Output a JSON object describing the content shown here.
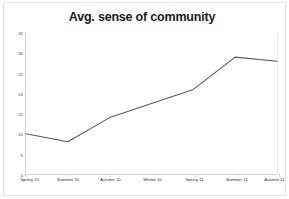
{
  "chart_data": {
    "type": "line",
    "title": "Avg. sense of community",
    "xlabel": "",
    "ylabel": "",
    "categories": [
      "Spring 10",
      "Summer 10",
      "Autumn 10",
      "Winter 10",
      "Spring 11",
      "Summer 11",
      "Autumn 11"
    ],
    "series": [
      {
        "name": "Avg. sense of community",
        "values": [
          10,
          8,
          14,
          17.5,
          21,
          29,
          28
        ],
        "color": "#595959",
        "line_width": 1.1,
        "markers": false
      }
    ],
    "ylim": [
      0,
      35
    ],
    "yticks": [
      0,
      5,
      10,
      15,
      20,
      25,
      30,
      35
    ],
    "ytick_labels": [
      "0",
      "5",
      "10",
      "15",
      "20",
      "25",
      "30",
      "35"
    ],
    "grid": false,
    "legend": false,
    "legend_position": "none",
    "axis_color": "#d2d2d2",
    "background": "#ffffff",
    "title_color": "#1b1b1b"
  }
}
